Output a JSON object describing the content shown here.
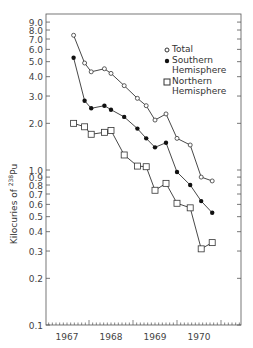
{
  "chart_data": {
    "type": "line",
    "title": "",
    "xlabel": "",
    "ylabel": "Kilocuries of 238Pu",
    "yscale": "log",
    "ylim": [
      0.1,
      10
    ],
    "xlim": [
      1967.0,
      1971.4
    ],
    "x_tick_labels": [
      "1967",
      "1968",
      "1969",
      "1970"
    ],
    "y_tick_labels": [
      "0.1",
      "0.2",
      "0.3",
      "0.4",
      "0.5",
      "0.6",
      "0.7",
      "0.8",
      "0.9",
      "1.0",
      "2.0",
      "3.0",
      "4.0",
      "5.0",
      "6.0",
      "7.0",
      "8.0",
      "9.0"
    ],
    "grid": false,
    "legend_position": "upper right",
    "x": [
      1967.65,
      1967.9,
      1968.05,
      1968.35,
      1968.5,
      1968.8,
      1969.1,
      1969.3,
      1969.5,
      1969.75,
      1970.0,
      1970.3,
      1970.55,
      1970.8
    ],
    "series": [
      {
        "name": "Total",
        "marker": "open-circle",
        "values": [
          7.4,
          4.9,
          4.3,
          4.5,
          4.2,
          3.5,
          2.9,
          2.6,
          2.1,
          2.3,
          1.6,
          1.45,
          0.9,
          0.85
        ]
      },
      {
        "name": "Southern Hemisphere",
        "marker": "filled-circle",
        "values": [
          5.3,
          2.8,
          2.5,
          2.6,
          2.45,
          2.2,
          1.85,
          1.6,
          1.4,
          1.5,
          0.97,
          0.8,
          0.63,
          0.53
        ]
      },
      {
        "name": "Northern Hemisphere",
        "marker": "open-square",
        "values": [
          2.0,
          1.9,
          1.7,
          1.75,
          1.8,
          1.25,
          1.06,
          1.05,
          0.74,
          0.82,
          0.61,
          0.57,
          0.31,
          0.34
        ]
      }
    ]
  },
  "legend": {
    "total": "Total",
    "southern_1": "Southern",
    "southern_2": "Hemisphere",
    "northern_1": "Northern",
    "northern_2": "Hemisphere"
  },
  "axis": {
    "ylabel_main": "Kilocuries of ",
    "ylabel_sup": "238",
    "ylabel_tail": "Pu"
  }
}
